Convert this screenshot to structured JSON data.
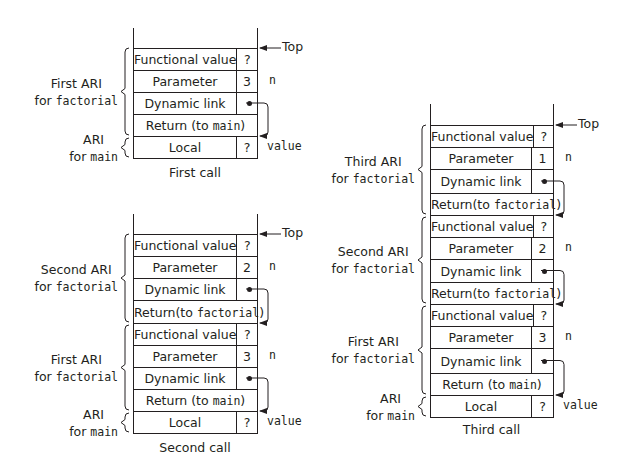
{
  "figure": {
    "top_label": "Top",
    "diagrams": [
      {
        "id": "first-call",
        "caption": "First call",
        "left": 133,
        "right": 257,
        "divider": 236,
        "rail_top": 28,
        "table_top": 48,
        "rows": [
          {
            "label": "Functional value",
            "value": "?",
            "h": 22
          },
          {
            "label": "Parameter",
            "value": "3",
            "note": "n",
            "h": 22
          },
          {
            "label": "Dynamic link",
            "value": "dot",
            "h": 22
          },
          {
            "label": "Return (to ",
            "code": "main",
            "suffix": ")",
            "h": 22,
            "full": true
          },
          {
            "label": "Local",
            "value": "?",
            "note": "value",
            "h": 22
          }
        ],
        "links": [
          {
            "from": 2,
            "to": 4
          }
        ],
        "groups": [
          {
            "line1": "First ARI",
            "line2_prefix": "for ",
            "line2_code": "factorial",
            "start": 0,
            "end": 4
          },
          {
            "line1": "ARI",
            "line2_prefix": "for ",
            "line2_code": "main",
            "start": 4,
            "end": 5
          }
        ],
        "caption_y": 165
      },
      {
        "id": "second-call",
        "caption": "Second call",
        "left": 133,
        "right": 257,
        "divider": 236,
        "rail_top": 214,
        "table_top": 234,
        "rows": [
          {
            "label": "Functional value",
            "value": "?",
            "h": 22
          },
          {
            "label": "Parameter",
            "value": "2",
            "note": "n",
            "h": 22
          },
          {
            "label": "Dynamic link",
            "value": "dot",
            "h": 22
          },
          {
            "label": "Return(to ",
            "code": "factorial",
            "suffix": ")",
            "h": 23,
            "full": true
          },
          {
            "label": "Functional value",
            "value": "?",
            "h": 22
          },
          {
            "label": "Parameter",
            "value": "3",
            "note": "n",
            "h": 22
          },
          {
            "label": "Dynamic link",
            "value": "dot",
            "h": 22
          },
          {
            "label": "Return (to ",
            "code": "main",
            "suffix": ")",
            "h": 22,
            "full": true
          },
          {
            "label": "Local",
            "value": "?",
            "note": "value",
            "h": 22
          }
        ],
        "links": [
          {
            "from": 2,
            "to": 4
          },
          {
            "from": 6,
            "to": 8
          }
        ],
        "groups": [
          {
            "line1": "Second ARI",
            "line2_prefix": "for ",
            "line2_code": "factorial",
            "start": 0,
            "end": 4
          },
          {
            "line1": "First ARI",
            "line2_prefix": "for ",
            "line2_code": "factorial",
            "start": 4,
            "end": 8
          },
          {
            "line1": "ARI",
            "line2_prefix": "for ",
            "line2_code": "main",
            "start": 8,
            "end": 9
          }
        ],
        "caption_y": 440
      },
      {
        "id": "third-call",
        "caption": "Third call",
        "left": 430,
        "right": 553,
        "divider": 531,
        "rail_top": 104,
        "table_top": 125,
        "rows": [
          {
            "label": "Functional value",
            "value": "?",
            "h": 22
          },
          {
            "label": "Parameter",
            "value": "1",
            "note": "n",
            "h": 22
          },
          {
            "label": "Dynamic link",
            "value": "dot",
            "h": 24
          },
          {
            "label": "Return(to ",
            "code": "factorial",
            "suffix": ")",
            "h": 22,
            "full": true
          },
          {
            "label": "Functional value",
            "value": "?",
            "h": 22
          },
          {
            "label": "Parameter",
            "value": "2",
            "note": "n",
            "h": 22
          },
          {
            "label": "Dynamic link",
            "value": "dot",
            "h": 23
          },
          {
            "label": "Return(to ",
            "code": "factorial",
            "suffix": ")",
            "h": 22,
            "full": true
          },
          {
            "label": "Functional value",
            "value": "?",
            "h": 22
          },
          {
            "label": "Parameter",
            "value": "3",
            "note": "n",
            "h": 22
          },
          {
            "label": "Dynamic link",
            "value": "dot",
            "h": 25
          },
          {
            "label": "Return (to ",
            "code": "main",
            "suffix": ")",
            "h": 22,
            "full": true
          },
          {
            "label": "Local",
            "value": "?",
            "note": "value",
            "h": 22
          }
        ],
        "links": [
          {
            "from": 2,
            "to": 4
          },
          {
            "from": 6,
            "to": 8
          },
          {
            "from": 10,
            "to": 12
          }
        ],
        "groups": [
          {
            "line1": "Third ARI",
            "line2_prefix": "for ",
            "line2_code": "factorial",
            "start": 0,
            "end": 4
          },
          {
            "line1": "Second ARI",
            "line2_prefix": "for ",
            "line2_code": "factorial",
            "start": 4,
            "end": 8
          },
          {
            "line1": "First ARI",
            "line2_prefix": "for ",
            "line2_code": "factorial",
            "start": 8,
            "end": 12
          },
          {
            "line1": "ARI",
            "line2_prefix": "for ",
            "line2_code": "main",
            "start": 12,
            "end": 13
          }
        ],
        "caption_y": 422
      }
    ]
  }
}
